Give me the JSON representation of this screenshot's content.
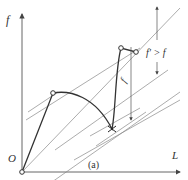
{
  "diagram": {
    "axes": {
      "y_label": "f",
      "x_label": "L",
      "origin_label": "O"
    },
    "caption": "(a)",
    "annotations": {
      "gap_small": "f",
      "gap_large": "f' > f"
    },
    "colors": {
      "curve": "#333333",
      "guide_lines": "#777777",
      "axes": "#555555"
    }
  }
}
